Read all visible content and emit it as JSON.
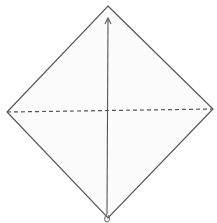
{
  "diagram": {
    "type": "origami-fold-step",
    "paper": {
      "shape": "square-diamond",
      "vertices": {
        "top": [
          108,
          6
        ],
        "right": [
          213,
          109
        ],
        "bottom": [
          108,
          218
        ],
        "left": [
          7,
          112
        ]
      },
      "fill": "#fbfbfb",
      "stroke": "#555555"
    },
    "fold_line": {
      "style": "valley-dashed",
      "from": [
        7,
        112
      ],
      "to": [
        213,
        109
      ],
      "stroke": "#555555"
    },
    "arrow": {
      "meaning": "fold-bottom-corner-up-to-top",
      "from": [
        107,
        216
      ],
      "to": [
        108,
        18
      ],
      "stroke": "#555555"
    }
  }
}
